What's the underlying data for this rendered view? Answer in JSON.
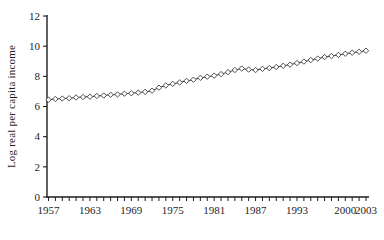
{
  "chart_data": {
    "type": "line",
    "title": "",
    "xlabel": "",
    "ylabel": "Log real per capita income",
    "x": [
      1957,
      1958,
      1959,
      1960,
      1961,
      1962,
      1963,
      1964,
      1965,
      1966,
      1967,
      1968,
      1969,
      1970,
      1971,
      1972,
      1973,
      1974,
      1975,
      1976,
      1977,
      1978,
      1979,
      1980,
      1981,
      1982,
      1983,
      1984,
      1985,
      1986,
      1987,
      1988,
      1989,
      1990,
      1991,
      1992,
      1993,
      1994,
      1995,
      1996,
      1997,
      1998,
      1999,
      2000,
      2001,
      2002,
      2003
    ],
    "values": [
      6.45,
      6.5,
      6.53,
      6.55,
      6.6,
      6.63,
      6.65,
      6.7,
      6.73,
      6.78,
      6.8,
      6.85,
      6.88,
      6.92,
      6.97,
      7.05,
      7.25,
      7.4,
      7.5,
      7.6,
      7.7,
      7.78,
      7.9,
      7.98,
      8.05,
      8.15,
      8.28,
      8.42,
      8.52,
      8.45,
      8.42,
      8.5,
      8.55,
      8.62,
      8.7,
      8.78,
      8.88,
      8.98,
      9.08,
      9.18,
      9.28,
      9.35,
      9.42,
      9.5,
      9.57,
      9.63,
      9.7
    ],
    "ylim": [
      0,
      12
    ],
    "yticks": [
      0,
      2,
      4,
      6,
      8,
      10,
      12
    ],
    "xtick_labels": [
      "1957",
      "1963",
      "1969",
      "1975",
      "1981",
      "1987",
      "1993",
      "2000",
      "2003"
    ],
    "grid": "off",
    "legend": "none",
    "marker": "open-diamond",
    "line_color": "#3c3c3c",
    "marker_fill": "#ffffff",
    "axis_color": "#1d1d1d",
    "text_color": "#1d1d1d",
    "background": "#ffffff"
  }
}
